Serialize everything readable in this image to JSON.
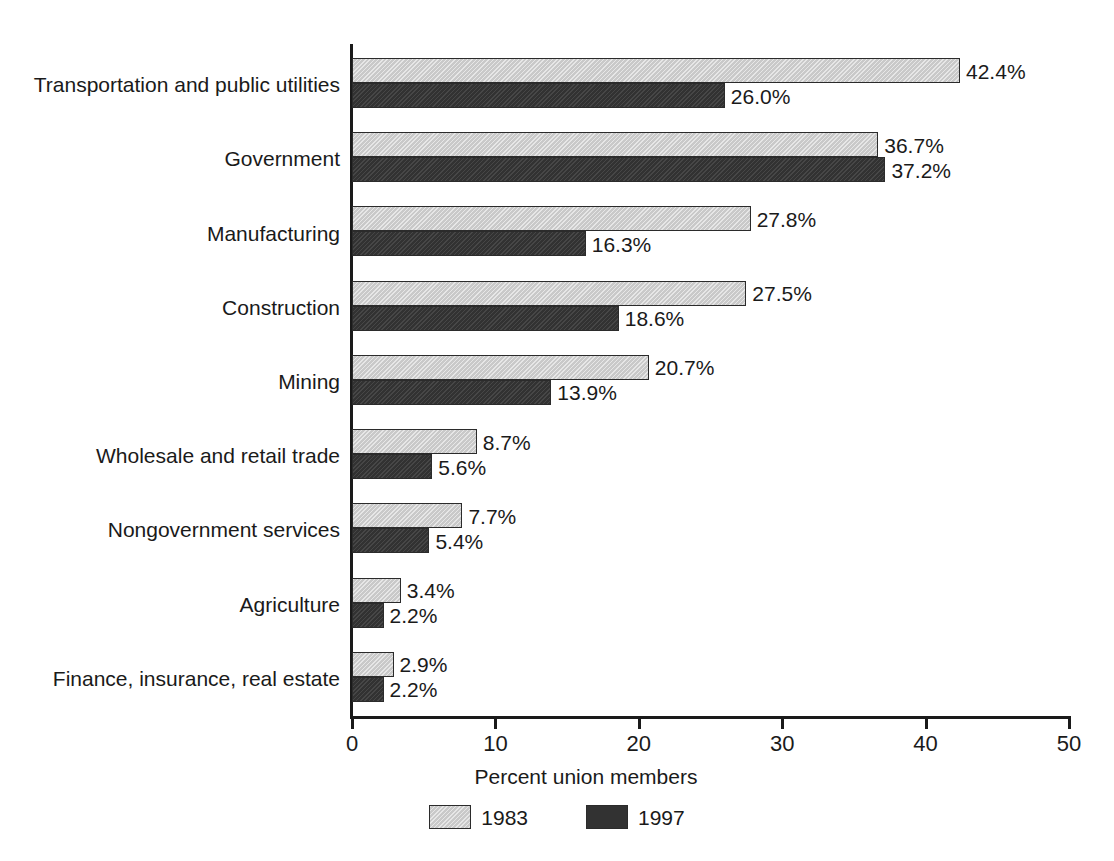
{
  "chart_data": {
    "type": "bar",
    "orientation": "horizontal",
    "title": "",
    "xlabel": "Percent union members",
    "ylabel": "",
    "xlim": [
      0,
      50
    ],
    "xticks": [
      0,
      10,
      20,
      30,
      40,
      50
    ],
    "xtick_labels": [
      "0",
      "10",
      "20",
      "30",
      "40",
      "50"
    ],
    "grid": false,
    "legend_position": "bottom-center",
    "categories": [
      "Transportation and public utilities",
      "Government",
      "Manufacturing",
      "Construction",
      "Mining",
      "Wholesale and retail trade",
      "Nongovernment services",
      "Agriculture",
      "Finance, insurance, real estate"
    ],
    "series": [
      {
        "name": "1983",
        "color": "#c9c9c9",
        "values": [
          42.4,
          36.7,
          27.8,
          27.5,
          20.7,
          8.7,
          7.7,
          3.4,
          2.9
        ],
        "labels": [
          "42.4%",
          "36.7%",
          "27.8%",
          "27.5%",
          "20.7%",
          "8.7%",
          "7.7%",
          "3.4%",
          "2.9%"
        ]
      },
      {
        "name": "1997",
        "color": "#323232",
        "values": [
          26.0,
          37.2,
          16.3,
          18.6,
          13.9,
          5.6,
          5.4,
          2.2,
          2.2
        ],
        "labels": [
          "26.0%",
          "37.2%",
          "16.3%",
          "18.6%",
          "13.9%",
          "5.6%",
          "5.4%",
          "2.2%",
          "2.2%"
        ]
      }
    ]
  },
  "legend": {
    "items": [
      {
        "label": "1983",
        "color": "#c9c9c9"
      },
      {
        "label": "1997",
        "color": "#323232"
      }
    ]
  },
  "axis": {
    "x_title": "Percent union members"
  }
}
